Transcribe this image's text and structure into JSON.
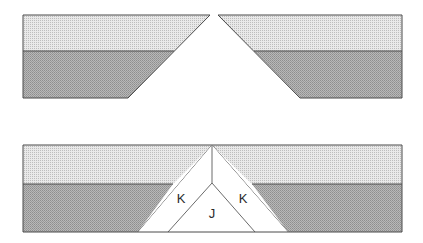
{
  "figure": {
    "background_color": "#ffffff",
    "outline_color": "#4a4a4a",
    "outline_width": 1
  },
  "layers": {
    "upper_unit": {
      "name": "upper-stratigraphic-unit",
      "fill_color": "#d5d5d5",
      "pattern": "fine-stipple-light"
    },
    "lower_unit": {
      "name": "lower-stratigraphic-unit",
      "fill_color": "#a8a8a8",
      "pattern": "fine-stipple-dark"
    },
    "void": {
      "name": "void-white-wedge",
      "fill_color": "#ffffff"
    }
  },
  "panels": [
    {
      "id": "panel-upper",
      "name": "upper-panel-separated-blocks",
      "caption": "",
      "blocks": [
        {
          "id": "block-left",
          "name": "left-fault-block",
          "outline": "23,15 210,15 128,98 23,98",
          "upper_unit_path": "23,15 210,15 174,51 23,51",
          "lower_unit_path": "23,51 174,51 128,98 23,98",
          "boundary_line": "23,51 174,51",
          "fault_line": "210,15 128,98"
        },
        {
          "id": "block-right",
          "name": "right-fault-block",
          "outline": "218,15 402,15 402,98 300,98",
          "upper_unit_path": "218,15 402,15 402,51 254,51",
          "lower_unit_path": "254,51 402,51 402,98 300,98",
          "boundary_line": "254,51 402,51",
          "fault_line": "218,15 300,98"
        }
      ],
      "gap": {
        "name": "extension-gap",
        "top_left_x": 210,
        "top_right_x": 218,
        "apex_y": 15
      }
    },
    {
      "id": "panel-lower",
      "name": "lower-panel-wedge-fill",
      "caption": "",
      "frame": {
        "name": "cross-section-frame",
        "left": 23,
        "top": 145,
        "right": 402,
        "bottom": 232
      },
      "blocks": [
        {
          "id": "block-left-lower",
          "name": "left-fault-block-lower",
          "outline": "23,145 212,145 138,232 23,232",
          "upper_unit_path": "23,145 212,145 173,184 23,184",
          "lower_unit_path": "23,184 173,184 138,232 23,232",
          "boundary_line": "23,184 173,184",
          "fault_line": "212,145 138,232"
        },
        {
          "id": "block-right-lower",
          "name": "right-fault-block-lower",
          "outline": "212,145 402,145 402,232 288,232",
          "upper_unit_path": "212,145 402,145 402,184 252,184",
          "lower_unit_path": "252,184 402,184 402,232 288,232",
          "boundary_line": "252,184 402,184",
          "fault_line": "212,145 288,232"
        }
      ],
      "wedge": {
        "name": "syn-rift-wedge",
        "apex_x": 212,
        "apex_y": 145,
        "inner_vertex_x": 212,
        "inner_vertex_y": 183,
        "outer_left_base_x": 138,
        "outer_right_base_x": 288,
        "inner_left_base_x": 168,
        "inner_right_base_x": 255,
        "base_y": 232,
        "axial_line": "212,145 212,183",
        "inner_left_line": "212,183 168,232",
        "inner_right_line": "212,183 255,232"
      }
    }
  ],
  "unit_labels": [
    {
      "id": "label-k-left",
      "name": "unit-label-k-left",
      "text": "K",
      "x": 181,
      "y": 203
    },
    {
      "id": "label-k-right",
      "name": "unit-label-k-right",
      "text": "K",
      "x": 243,
      "y": 203
    },
    {
      "id": "label-j",
      "name": "unit-label-j",
      "text": "J",
      "x": 212,
      "y": 218
    }
  ]
}
